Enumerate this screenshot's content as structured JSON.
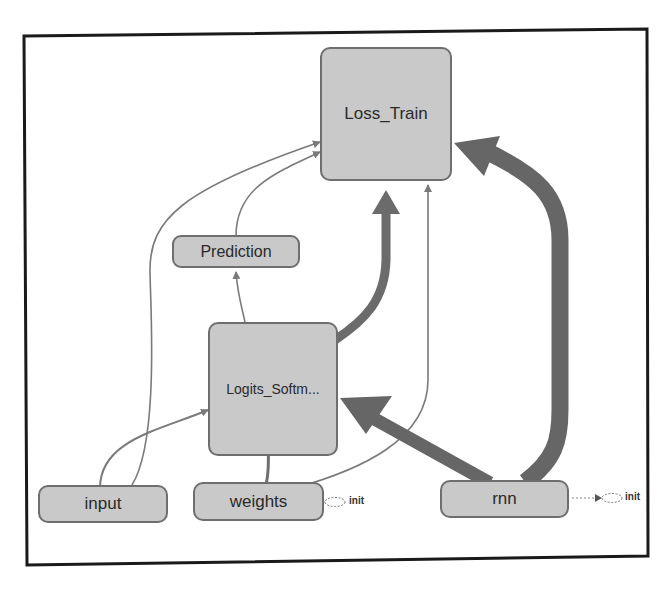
{
  "diagram": {
    "type": "computation-graph",
    "colors": {
      "node_fill": "#c9c9c9",
      "node_border": "#6e6e6e",
      "edge_thin": "#7a7a7a",
      "edge_thick": "#6b6b6b",
      "frame": "#1a1a1a"
    },
    "nodes": {
      "loss_train": {
        "label": "Loss_Train"
      },
      "prediction": {
        "label": "Prediction"
      },
      "logits": {
        "label": "Logits_Softm..."
      },
      "input": {
        "label": "input"
      },
      "weights": {
        "label": "weights"
      },
      "rnn": {
        "label": "rnn"
      }
    },
    "aux": {
      "weights_init": {
        "label": "init"
      },
      "rnn_init": {
        "label": "init"
      }
    },
    "edges": [
      {
        "from": "input",
        "to": "logits",
        "weight": "thin"
      },
      {
        "from": "input",
        "to": "loss_train",
        "weight": "thin"
      },
      {
        "from": "weights",
        "to": "logits",
        "weight": "medium"
      },
      {
        "from": "weights",
        "to": "loss_train",
        "weight": "thin"
      },
      {
        "from": "logits",
        "to": "prediction",
        "weight": "thin"
      },
      {
        "from": "prediction",
        "to": "loss_train",
        "weight": "thin"
      },
      {
        "from": "logits",
        "to": "loss_train",
        "weight": "thick"
      },
      {
        "from": "rnn",
        "to": "logits",
        "weight": "thick"
      },
      {
        "from": "rnn",
        "to": "loss_train",
        "weight": "thick"
      },
      {
        "from": "weights",
        "to": "weights_init",
        "weight": "dotted"
      },
      {
        "from": "rnn",
        "to": "rnn_init",
        "weight": "dotted"
      }
    ]
  }
}
